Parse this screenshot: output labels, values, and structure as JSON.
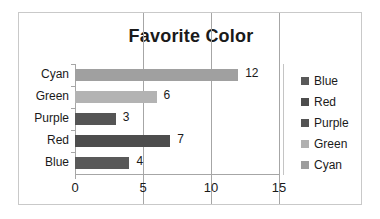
{
  "chart_data": {
    "type": "bar",
    "orientation": "horizontal",
    "title": "Favorite Color",
    "xlabel": "",
    "ylabel": "",
    "categories": [
      "Blue",
      "Red",
      "Purple",
      "Green",
      "Cyan"
    ],
    "values": [
      4,
      7,
      3,
      6,
      12
    ],
    "value_labels": [
      "4",
      "7",
      "3",
      "6",
      "12"
    ],
    "xlim": [
      0,
      15
    ],
    "xticks": [
      0,
      5,
      10,
      15
    ],
    "xtick_labels": [
      "0",
      "5",
      "10",
      "15"
    ],
    "grid": "vertical",
    "legend_position": "right",
    "legend": [
      {
        "label": "Blue",
        "color": "#595959"
      },
      {
        "label": "Red",
        "color": "#4d4d4d"
      },
      {
        "label": "Purple",
        "color": "#545454"
      },
      {
        "label": "Green",
        "color": "#b0b0b0"
      },
      {
        "label": "Cyan",
        "color": "#9d9d9d"
      }
    ],
    "bars": [
      {
        "category": "Cyan",
        "value": 12,
        "label": "12",
        "color": "#a0a0a0"
      },
      {
        "category": "Green",
        "value": 6,
        "label": "6",
        "color": "#b3b3b3"
      },
      {
        "category": "Purple",
        "value": 3,
        "label": "3",
        "color": "#555555"
      },
      {
        "category": "Red",
        "value": 7,
        "label": "7",
        "color": "#4d4d4d"
      },
      {
        "category": "Blue",
        "value": 4,
        "label": "4",
        "color": "#595959"
      }
    ],
    "axis_color": "#a6a6a6",
    "text_color": "#1a1a1a",
    "frame_color": "#c9c9c9"
  }
}
